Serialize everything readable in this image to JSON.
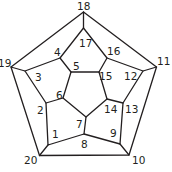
{
  "diagram": {
    "type": "dodecahedron-schlegel-graph",
    "labels": [
      {
        "id": "18",
        "text": "18",
        "x": 77,
        "y": 10
      },
      {
        "id": "11",
        "text": "11",
        "x": 157,
        "y": 65
      },
      {
        "id": "10",
        "text": "10",
        "x": 132,
        "y": 162
      },
      {
        "id": "20",
        "text": "20",
        "x": 24,
        "y": 162
      },
      {
        "id": "19",
        "text": "19",
        "x": 0,
        "y": 67
      },
      {
        "id": "17",
        "text": "17",
        "x": 79,
        "y": 47
      },
      {
        "id": "4",
        "text": "4",
        "x": 54,
        "y": 55
      },
      {
        "id": "16",
        "text": "16",
        "x": 107,
        "y": 54
      },
      {
        "id": "5",
        "text": "5",
        "x": 73,
        "y": 70
      },
      {
        "id": "15",
        "text": "15",
        "x": 99,
        "y": 80
      },
      {
        "id": "12",
        "text": "12",
        "x": 124,
        "y": 80
      },
      {
        "id": "3",
        "text": "3",
        "x": 34,
        "y": 80
      },
      {
        "id": "6",
        "text": "6",
        "x": 55,
        "y": 98
      },
      {
        "id": "2",
        "text": "2",
        "x": 36,
        "y": 113
      },
      {
        "id": "14",
        "text": "14",
        "x": 103,
        "y": 113
      },
      {
        "id": "13",
        "text": "13",
        "x": 124,
        "y": 113
      },
      {
        "id": "7",
        "text": "7",
        "x": 75,
        "y": 127
      },
      {
        "id": "1",
        "text": "1",
        "x": 51,
        "y": 137
      },
      {
        "id": "9",
        "text": "9",
        "x": 109,
        "y": 136
      },
      {
        "id": "8",
        "text": "8",
        "x": 80,
        "y": 147
      }
    ]
  }
}
